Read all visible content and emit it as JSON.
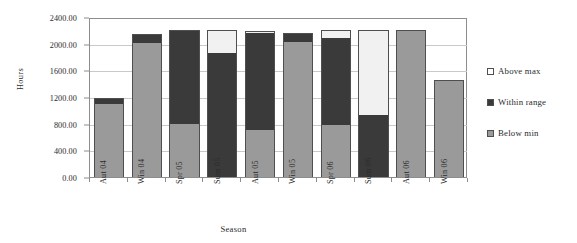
{
  "chart_data": {
    "type": "bar",
    "stacked": true,
    "title": "",
    "xlabel": "Season",
    "ylabel": "Hours",
    "ylim": [
      0,
      2400
    ],
    "ytick_step": 400,
    "grid": true,
    "legend_position": "right",
    "categories": [
      "Aut 04",
      "Win 04",
      "Spr 05",
      "Sum 05",
      "Aut 05",
      "Win 05",
      "Spr 06",
      "Sum 06",
      "Aut 06",
      "Win 06"
    ],
    "ytick_labels": [
      "0.00",
      "400.00",
      "800.00",
      "1200.00",
      "1600.00",
      "2000.00",
      "2400.00"
    ],
    "ytick_values": [
      0,
      400,
      800,
      1200,
      1600,
      2000,
      2400
    ],
    "series": [
      {
        "name": "Below min",
        "color": "#9a9a9a",
        "values": [
          1090,
          2010,
          790,
          0,
          700,
          2030,
          780,
          0,
          2200,
          1460
        ]
      },
      {
        "name": "Within range",
        "color": "#3a3a3a",
        "values": [
          90,
          140,
          1420,
          1860,
          1460,
          130,
          1300,
          930,
          0,
          0
        ]
      },
      {
        "name": "Above max",
        "color": "#f1f1f1",
        "values": [
          0,
          0,
          0,
          350,
          30,
          0,
          130,
          1280,
          0,
          0
        ]
      }
    ],
    "totals": [
      1180,
      2150,
      2210,
      2210,
      2190,
      2160,
      2210,
      2210,
      2200,
      1460
    ]
  },
  "legend": {
    "items": [
      {
        "label": "Above max",
        "swatch": "swatch-above"
      },
      {
        "label": "Within range",
        "swatch": "swatch-within"
      },
      {
        "label": "Below min",
        "swatch": "swatch-below"
      }
    ]
  },
  "axes": {
    "y_title": "Hours",
    "x_title": "Season"
  }
}
